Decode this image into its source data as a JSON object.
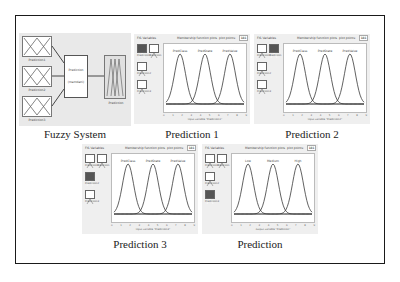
{
  "figure": {
    "panels": [
      {
        "id": "fuzzy-system",
        "caption": "Fuzzy System",
        "inputs": [
          "Prediction1",
          "Prediction2",
          "Prediction3"
        ],
        "engine": {
          "line1": "Prediction",
          "line2": "(mamdani)"
        },
        "output": "Prediction"
      },
      {
        "id": "prediction-1",
        "caption": "Prediction 1",
        "fis_variables_label": "FIS Variables",
        "mf_plots_label": "Membership function plots",
        "plot_points_label": "plot points:",
        "plot_points_value": "181",
        "mf_labels": [
          "PredClass",
          "PredState",
          "PredValue"
        ],
        "xlabel": "input variable \"Prediction1\"",
        "selected_var": 0
      },
      {
        "id": "prediction-2",
        "caption": "Prediction 2",
        "fis_variables_label": "FIS Variables",
        "mf_plots_label": "Membership function plots",
        "plot_points_label": "plot points:",
        "plot_points_value": "181",
        "mf_labels": [
          "PredClass",
          "PredState",
          "PredValue"
        ],
        "xlabel": "input variable \"Prediction2\"",
        "selected_var": 1
      },
      {
        "id": "prediction-3",
        "caption": "Prediction 3",
        "fis_variables_label": "FIS Variables",
        "mf_plots_label": "Membership function plots",
        "plot_points_label": "plot points:",
        "plot_points_value": "181",
        "mf_labels": [
          "PredClass",
          "PredState",
          "PredValue"
        ],
        "xlabel": "input variable \"Prediction3\"",
        "selected_var": 2
      },
      {
        "id": "prediction",
        "caption": "Prediction",
        "fis_variables_label": "FIS Variables",
        "mf_plots_label": "Membership function plots",
        "plot_points_label": "plot points:",
        "plot_points_value": "181",
        "mf_labels": [
          "Low",
          "Medium",
          "High"
        ],
        "xlabel": "output variable \"Prediction\"",
        "selected_var": 3
      }
    ],
    "var_labels": [
      "Prediction1",
      "Prediction",
      "Prediction2",
      "Prediction3"
    ],
    "ticks": [
      "0",
      "1",
      "2",
      "3",
      "4",
      "5",
      "6",
      "7",
      "8",
      "9"
    ],
    "colors": {
      "curve": "#3a3a3a",
      "frame": "#1a1a1a",
      "panel_bg": "#ececec"
    }
  }
}
